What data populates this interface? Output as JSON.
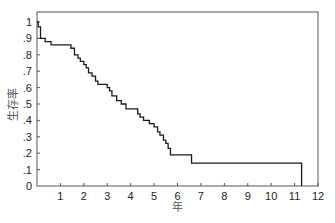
{
  "chart_data": {
    "type": "line",
    "subtype": "step (Kaplan-Meier survival curve)",
    "title": "",
    "xlabel": "年",
    "ylabel": "生存率",
    "xlim": [
      0,
      12
    ],
    "ylim": [
      0,
      1
    ],
    "x_ticks": [
      "1",
      "2",
      "3",
      "4",
      "5",
      "6",
      "7",
      "8",
      "9",
      "10",
      "11",
      "12"
    ],
    "y_ticks": [
      "0",
      ".1",
      ".2",
      ".3",
      ".4",
      ".5",
      ".6",
      ".7",
      ".8",
      ".9",
      "1"
    ],
    "grid": false,
    "legend": null,
    "series": [
      {
        "name": "survival",
        "color": "#1a1a1a",
        "x": [
          0,
          0.05,
          0.15,
          0.35,
          0.6,
          1.45,
          1.6,
          1.75,
          1.85,
          2.0,
          2.1,
          2.2,
          2.35,
          2.5,
          2.6,
          3.0,
          3.1,
          3.2,
          3.4,
          3.6,
          3.8,
          4.3,
          4.4,
          4.55,
          4.8,
          5.0,
          5.15,
          5.25,
          5.4,
          5.5,
          5.6,
          5.7,
          6.6,
          11.3
        ],
        "y": [
          1.0,
          0.97,
          0.9,
          0.88,
          0.86,
          0.84,
          0.8,
          0.78,
          0.76,
          0.74,
          0.72,
          0.69,
          0.67,
          0.64,
          0.62,
          0.6,
          0.58,
          0.55,
          0.52,
          0.5,
          0.47,
          0.44,
          0.42,
          0.4,
          0.38,
          0.36,
          0.33,
          0.31,
          0.28,
          0.26,
          0.23,
          0.19,
          0.14,
          0.0
        ]
      }
    ]
  },
  "axes": {
    "xlabel": "年",
    "ylabel": "生存率"
  }
}
